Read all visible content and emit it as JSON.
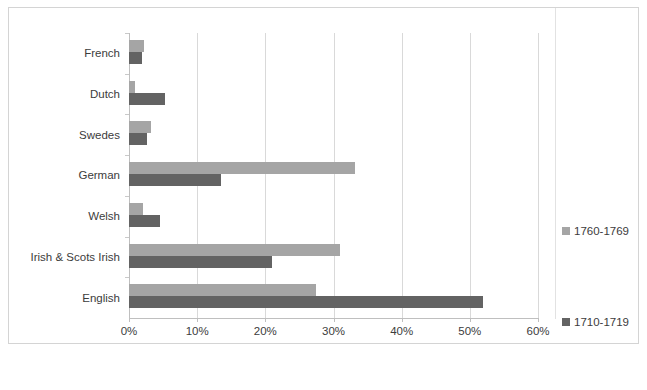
{
  "chart_data": {
    "type": "bar",
    "orientation": "horizontal",
    "title": "",
    "subtitle": "",
    "xlabel": "",
    "ylabel": "",
    "xlim": [
      0,
      60
    ],
    "xtick_labels": [
      "0%",
      "10%",
      "20%",
      "30%",
      "40%",
      "50%",
      "60%"
    ],
    "xtick_values": [
      0,
      10,
      20,
      30,
      40,
      50,
      60
    ],
    "grid": "vertical",
    "legend_position": "right",
    "categories": [
      "French",
      "Dutch",
      "Swedes",
      "German",
      "Welsh",
      "Irish & Scots Irish",
      "English"
    ],
    "series": [
      {
        "name": "1760-1769",
        "color": "#a5a5a5",
        "values": [
          2.2,
          0.9,
          3.3,
          33.2,
          2.0,
          30.9,
          27.5
        ]
      },
      {
        "name": "1710-1719",
        "color": "#636363",
        "values": [
          1.9,
          5.3,
          2.7,
          13.5,
          4.5,
          21.0,
          52.0
        ]
      }
    ]
  },
  "legend": {
    "entries": [
      {
        "label": "1760-1769",
        "color": "#a5a5a5"
      },
      {
        "label": "1710-1719",
        "color": "#636363"
      }
    ]
  }
}
